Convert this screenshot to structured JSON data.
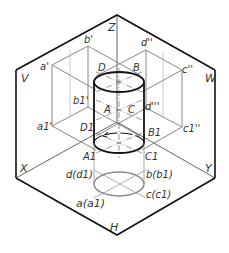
{
  "figure": {
    "colors": {
      "frame": "#111111",
      "projection": "#888888",
      "cylinder": "#111111",
      "center_line": "#555555",
      "background": "#ffffff"
    },
    "planes": {
      "v": "V",
      "w": "W",
      "h": "H"
    },
    "axes": {
      "z": "Z",
      "x": "X",
      "y": "Y"
    },
    "points_3d": {
      "top": [
        "D",
        "B",
        "A",
        "C"
      ],
      "bottom": [
        "D1",
        "B1",
        "A1",
        "C1"
      ]
    },
    "labels": {
      "Z": "Z",
      "V": "V",
      "W": "W",
      "X": "X",
      "Y": "Y",
      "H": "H",
      "a_prime": "a'",
      "b_prime": "b'",
      "b1_prime": "b1'",
      "a1_prime": "a1'",
      "d_dprime": "d''",
      "c_dprime": "c''",
      "d1_dprime": "d'''",
      "c1_dprime": "c1''",
      "D": "D",
      "B": "B",
      "A": "A",
      "C": "C",
      "D1": "D1",
      "B1": "B1",
      "A1": "A1",
      "C1": "C1",
      "d_d1": "d(d1)",
      "b_b1": "b(b1)",
      "c_c1": "c(c1)",
      "a_a1": "a(a1)"
    }
  }
}
